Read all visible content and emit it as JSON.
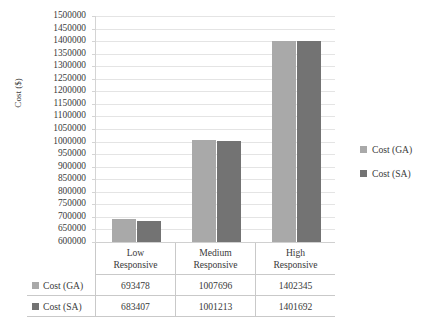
{
  "chart_data": {
    "type": "bar",
    "title": "",
    "xlabel": "",
    "ylabel": "Cost ($)",
    "ylim": [
      600000,
      1500000
    ],
    "ytick_step": 50000,
    "grid": true,
    "legend_position": "right",
    "categories": [
      "Low Responsive",
      "Medium Responsive",
      "High Responsive"
    ],
    "category_lines": [
      [
        "Low",
        "Responsive"
      ],
      [
        "Medium",
        "Responsive"
      ],
      [
        "High",
        "Responsive"
      ]
    ],
    "series": [
      {
        "name": "Cost (GA)",
        "color": "#a9a9a9",
        "values": [
          693478,
          1007696,
          1402345
        ]
      },
      {
        "name": "Cost (SA)",
        "color": "#737373",
        "values": [
          683407,
          1001213,
          1401692
        ]
      }
    ],
    "ytick_labels": [
      "1500000",
      "1450000",
      "1400000",
      "1350000",
      "1300000",
      "1250000",
      "1200000",
      "1150000",
      "1100000",
      "1050000",
      "1000000",
      "950000",
      "900000",
      "850000",
      "800000",
      "750000",
      "700000",
      "650000",
      "600000"
    ]
  },
  "axis": {
    "y_title": "Cost ($)"
  },
  "legend": {
    "items": [
      {
        "label": "Cost (GA)",
        "color": "#a9a9a9"
      },
      {
        "label": "Cost (SA)",
        "color": "#737373"
      }
    ]
  },
  "data_table": {
    "rows": [
      {
        "label": "Cost (GA)",
        "color": "#a9a9a9",
        "values": [
          "693478",
          "1007696",
          "1402345"
        ]
      },
      {
        "label": "Cost (SA)",
        "color": "#737373",
        "values": [
          "683407",
          "1001213",
          "1401692"
        ]
      }
    ]
  }
}
